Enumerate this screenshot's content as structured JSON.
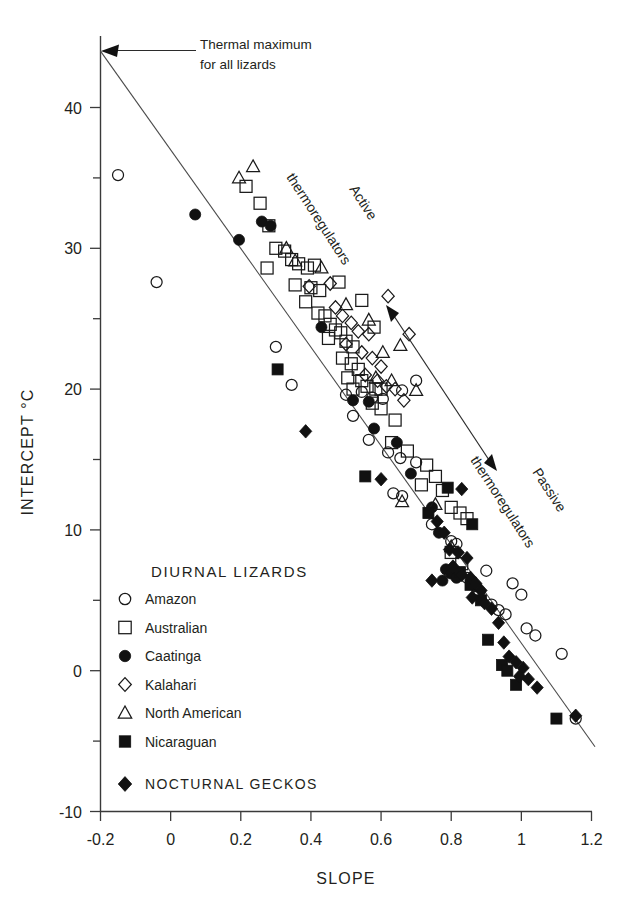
{
  "chart_data": {
    "type": "scatter",
    "title": "",
    "xlabel": "SLOPE",
    "ylabel": "INTERCEPT °C",
    "xlim": [
      -0.2,
      1.2
    ],
    "ylim": [
      -10,
      45
    ],
    "xticks": [
      "-0.2",
      "0",
      "0.2",
      "0.4",
      "0.6",
      "0.8",
      "1",
      "1.2"
    ],
    "xtick_values": [
      -0.2,
      0,
      0.2,
      0.4,
      0.6,
      0.8,
      1.0,
      1.2
    ],
    "yticks": [
      "40",
      "30",
      "20",
      "10",
      "0",
      "-10"
    ],
    "ytick_values": [
      40,
      30,
      20,
      10,
      0,
      -10
    ],
    "yminor_values": [
      35,
      25,
      15,
      5,
      -5
    ],
    "grid": false,
    "legend_position": "inside-lower-left",
    "annotations": [
      {
        "name": "thermal-maximum",
        "text_line1": "Thermal maximum",
        "text_line2": "for all lizards",
        "x": 0.0,
        "y": 44.0,
        "style": "arrow-left"
      },
      {
        "name": "active-thermoregulators",
        "text": "Active thermoregulators",
        "rotation": -57,
        "x": 0.42,
        "y": 30.0
      },
      {
        "name": "passive-thermoregulators",
        "text": "Passive thermoregulators",
        "rotation": -57,
        "x": 0.92,
        "y": 13.5
      },
      {
        "name": "gradient-arrow",
        "type": "double-headed-arrow",
        "x1": 0.62,
        "y1": 25.5,
        "x2": 0.92,
        "y2": 14.0
      }
    ],
    "fit_line": {
      "name": "thermal-constraint-line",
      "x1": -0.2,
      "y1": 44.0,
      "x2": 1.21,
      "y2": -5.4
    },
    "series": [
      {
        "name": "Amazon",
        "marker": "circle-open",
        "points": [
          [
            -0.15,
            35.2
          ],
          [
            -0.04,
            27.6
          ],
          [
            0.3,
            23.0
          ],
          [
            0.345,
            20.3
          ],
          [
            0.5,
            19.6
          ],
          [
            0.545,
            19.8
          ],
          [
            0.575,
            19.4
          ],
          [
            0.605,
            19.3
          ],
          [
            0.52,
            18.1
          ],
          [
            0.565,
            16.4
          ],
          [
            0.62,
            15.5
          ],
          [
            0.655,
            15.1
          ],
          [
            0.7,
            14.8
          ],
          [
            0.635,
            12.6
          ],
          [
            0.66,
            12.4
          ],
          [
            0.745,
            10.4
          ],
          [
            0.8,
            9.2
          ],
          [
            0.815,
            9.0
          ],
          [
            0.795,
            7.0
          ],
          [
            0.845,
            6.6
          ],
          [
            0.87,
            6.0
          ],
          [
            0.88,
            5.6
          ],
          [
            0.915,
            4.7
          ],
          [
            0.935,
            4.3
          ],
          [
            0.955,
            4.0
          ],
          [
            0.9,
            7.1
          ],
          [
            0.975,
            6.2
          ],
          [
            1.0,
            5.4
          ],
          [
            1.015,
            3.0
          ],
          [
            1.04,
            2.5
          ],
          [
            1.115,
            1.2
          ],
          [
            1.155,
            -3.4
          ],
          [
            0.7,
            20.6
          ],
          [
            0.66,
            19.9
          ]
        ]
      },
      {
        "name": "Australian",
        "marker": "square-open",
        "points": [
          [
            0.215,
            34.4
          ],
          [
            0.255,
            33.2
          ],
          [
            0.28,
            31.6
          ],
          [
            0.3,
            30.0
          ],
          [
            0.325,
            29.8
          ],
          [
            0.275,
            28.6
          ],
          [
            0.345,
            29.2
          ],
          [
            0.365,
            28.9
          ],
          [
            0.39,
            28.6
          ],
          [
            0.41,
            28.8
          ],
          [
            0.355,
            27.4
          ],
          [
            0.4,
            27.2
          ],
          [
            0.425,
            27.0
          ],
          [
            0.385,
            26.2
          ],
          [
            0.42,
            25.4
          ],
          [
            0.44,
            25.2
          ],
          [
            0.455,
            24.6
          ],
          [
            0.47,
            24.2
          ],
          [
            0.485,
            24.0
          ],
          [
            0.45,
            23.6
          ],
          [
            0.5,
            23.4
          ],
          [
            0.52,
            23.0
          ],
          [
            0.49,
            22.2
          ],
          [
            0.515,
            21.8
          ],
          [
            0.535,
            21.4
          ],
          [
            0.505,
            20.8
          ],
          [
            0.545,
            20.6
          ],
          [
            0.56,
            20.2
          ],
          [
            0.585,
            20.0
          ],
          [
            0.52,
            20.0
          ],
          [
            0.6,
            20.0
          ],
          [
            0.575,
            19.0
          ],
          [
            0.6,
            18.6
          ],
          [
            0.64,
            17.8
          ],
          [
            0.63,
            16.2
          ],
          [
            0.675,
            15.6
          ],
          [
            0.73,
            14.6
          ],
          [
            0.755,
            13.8
          ],
          [
            0.715,
            13.2
          ],
          [
            0.775,
            12.8
          ],
          [
            0.8,
            11.6
          ],
          [
            0.825,
            11.2
          ],
          [
            0.845,
            10.8
          ],
          [
            0.8,
            8.4
          ],
          [
            0.83,
            7.6
          ],
          [
            0.545,
            26.3
          ],
          [
            0.58,
            24.4
          ],
          [
            0.48,
            27.6
          ]
        ]
      },
      {
        "name": "Caatinga",
        "marker": "circle-filled",
        "points": [
          [
            0.07,
            32.4
          ],
          [
            0.195,
            30.6
          ],
          [
            0.26,
            31.9
          ],
          [
            0.285,
            31.6
          ],
          [
            0.43,
            24.4
          ],
          [
            0.52,
            19.2
          ],
          [
            0.565,
            19.1
          ],
          [
            0.58,
            17.2
          ],
          [
            0.645,
            16.2
          ],
          [
            0.685,
            14.0
          ],
          [
            0.745,
            11.6
          ],
          [
            0.765,
            9.8
          ],
          [
            0.785,
            7.2
          ],
          [
            0.8,
            6.9
          ],
          [
            0.775,
            6.4
          ],
          [
            0.815,
            6.6
          ]
        ]
      },
      {
        "name": "Kalahari",
        "marker": "diamond-open",
        "points": [
          [
            0.395,
            27.3
          ],
          [
            0.455,
            27.5
          ],
          [
            0.47,
            25.8
          ],
          [
            0.49,
            25.2
          ],
          [
            0.515,
            24.7
          ],
          [
            0.535,
            24.1
          ],
          [
            0.565,
            23.9
          ],
          [
            0.5,
            23.2
          ],
          [
            0.545,
            22.6
          ],
          [
            0.575,
            22.2
          ],
          [
            0.6,
            21.6
          ],
          [
            0.555,
            21.0
          ],
          [
            0.59,
            20.6
          ],
          [
            0.615,
            20.2
          ],
          [
            0.64,
            20.0
          ],
          [
            0.665,
            19.2
          ],
          [
            0.62,
            26.6
          ],
          [
            0.68,
            23.9
          ]
        ]
      },
      {
        "name": "North American",
        "marker": "triangle-open",
        "points": [
          [
            0.195,
            35.0
          ],
          [
            0.235,
            35.8
          ],
          [
            0.33,
            30.0
          ],
          [
            0.355,
            29.1
          ],
          [
            0.43,
            28.6
          ],
          [
            0.5,
            26.0
          ],
          [
            0.565,
            24.9
          ],
          [
            0.655,
            23.1
          ],
          [
            0.605,
            22.6
          ],
          [
            0.585,
            20.8
          ],
          [
            0.63,
            20.6
          ],
          [
            0.7,
            19.9
          ],
          [
            0.66,
            12.0
          ],
          [
            0.755,
            11.8
          ],
          [
            0.8,
            8.8
          ]
        ]
      },
      {
        "name": "Nicaraguan",
        "marker": "square-filled",
        "points": [
          [
            0.305,
            21.4
          ],
          [
            0.555,
            13.8
          ],
          [
            0.79,
            13.0
          ],
          [
            0.735,
            11.2
          ],
          [
            0.86,
            10.4
          ],
          [
            0.825,
            7.0
          ],
          [
            0.855,
            6.1
          ],
          [
            0.885,
            5.0
          ],
          [
            0.905,
            2.2
          ],
          [
            0.945,
            0.4
          ],
          [
            0.96,
            0.0
          ],
          [
            0.985,
            -1.0
          ],
          [
            1.1,
            -3.4
          ]
        ]
      },
      {
        "name": "NOCTURNAL GECKOS",
        "marker": "diamond-filled",
        "points": [
          [
            0.385,
            17.0
          ],
          [
            0.6,
            13.6
          ],
          [
            0.83,
            12.9
          ],
          [
            0.78,
            9.8
          ],
          [
            0.795,
            8.6
          ],
          [
            0.82,
            8.4
          ],
          [
            0.845,
            8.0
          ],
          [
            0.805,
            7.4
          ],
          [
            0.83,
            6.8
          ],
          [
            0.855,
            6.6
          ],
          [
            0.87,
            6.2
          ],
          [
            0.885,
            5.7
          ],
          [
            0.86,
            5.2
          ],
          [
            0.895,
            4.8
          ],
          [
            0.915,
            4.4
          ],
          [
            0.935,
            3.4
          ],
          [
            0.95,
            2.0
          ],
          [
            0.965,
            1.0
          ],
          [
            0.985,
            0.6
          ],
          [
            1.005,
            0.2
          ],
          [
            0.995,
            -0.4
          ],
          [
            1.02,
            -0.6
          ],
          [
            1.045,
            -1.2
          ],
          [
            1.155,
            -3.2
          ],
          [
            0.76,
            10.6
          ],
          [
            0.745,
            6.4
          ]
        ]
      }
    ]
  },
  "legend": {
    "title": "DIURNAL LIZARDS",
    "items": [
      {
        "label": "Amazon",
        "marker": "circle-open"
      },
      {
        "label": "Australian",
        "marker": "square-open"
      },
      {
        "label": "Caatinga",
        "marker": "circle-filled"
      },
      {
        "label": "Kalahari",
        "marker": "diamond-open"
      },
      {
        "label": "North American",
        "marker": "triangle-open"
      },
      {
        "label": "Nicaraguan",
        "marker": "square-filled"
      }
    ],
    "nocturnal": {
      "label": "NOCTURNAL GECKOS",
      "marker": "diamond-filled"
    }
  },
  "colors": {
    "marker": "#111111",
    "axis": "#3a3a3a",
    "text": "#231f20",
    "line": "#4a4a4a",
    "background": "#ffffff"
  }
}
